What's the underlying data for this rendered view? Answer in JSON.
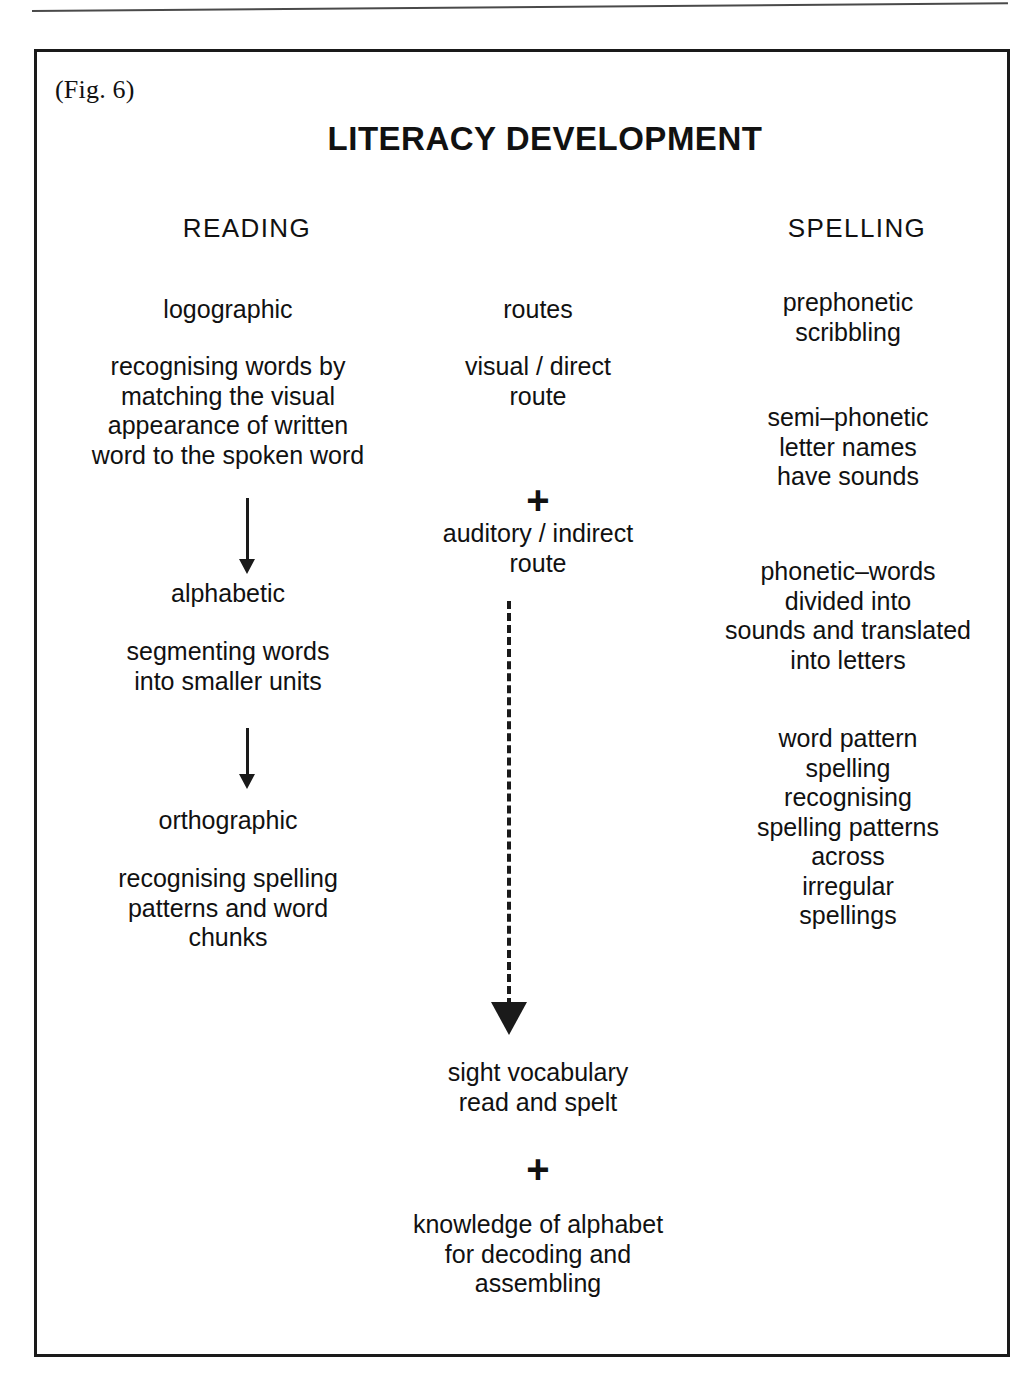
{
  "page": {
    "header_rule_fragment": "",
    "figure_label": "(Fig. 6)",
    "figure_title": "LITERACY DEVELOPMENT"
  },
  "columns": {
    "reading_header": "READING",
    "spelling_header": "SPELLING"
  },
  "reading": {
    "stage_1_name": "logographic",
    "stage_1_desc": "recognising words by\nmatching the visual\nappearance of written\nword to the spoken word",
    "stage_2_name": "alphabetic",
    "stage_2_desc": "segmenting words\ninto smaller units",
    "stage_3_name": "orthographic",
    "stage_3_desc": "recognising spelling\npatterns and word\nchunks"
  },
  "routes": {
    "heading": "routes",
    "visual_route": "visual / direct\nroute",
    "plus_1": "+",
    "auditory_route": "auditory / indirect\nroute",
    "outcome": "sight vocabulary\nread and spelt",
    "plus_2": "+",
    "requirement": "knowledge of alphabet\nfor decoding and\nassembling"
  },
  "spelling": {
    "stage_1": "prephonetic\nscribbling",
    "stage_2": "semi–phonetic\nletter names\nhave sounds",
    "stage_3": "phonetic–words\ndivided into\nsounds and translated\ninto letters",
    "stage_4": "word pattern\nspelling\nrecognising\nspelling patterns\nacross\nirregular\nspellings"
  },
  "icons": {
    "arrow_down_solid": "arrow-down-icon",
    "arrow_down_dashed": "dashed-arrow-down-icon",
    "plus": "plus-icon"
  },
  "colors": {
    "ink": "#1a1a1a",
    "paper": "#ffffff"
  }
}
